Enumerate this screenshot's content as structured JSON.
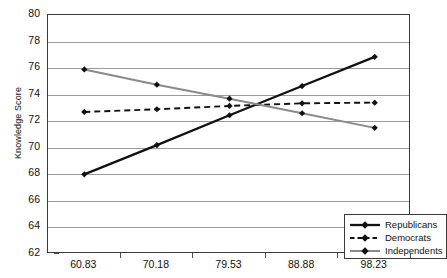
{
  "chart_data": {
    "type": "line",
    "title": "",
    "xlabel": "",
    "ylabel": "Knowledge Score",
    "categories": [
      "60.83",
      "70.18",
      "79.53",
      "88.88",
      "98.23"
    ],
    "ylim": [
      62,
      80
    ],
    "yticks": [
      62,
      64,
      66,
      68,
      70,
      72,
      74,
      76,
      78,
      80
    ],
    "grid": true,
    "legend_position": "bottom-right",
    "series": [
      {
        "name": "Republicans",
        "values": [
          68.0,
          70.2,
          72.45,
          74.65,
          76.85
        ],
        "color": "#111111",
        "style": "solid",
        "width": 2.3,
        "marker": "diamond"
      },
      {
        "name": "Democrats",
        "values": [
          72.7,
          72.9,
          73.15,
          73.35,
          73.4
        ],
        "color": "#111111",
        "style": "dashed",
        "width": 1.9,
        "marker": "diamond"
      },
      {
        "name": "Independents",
        "values": [
          75.9,
          74.75,
          73.7,
          72.6,
          71.5
        ],
        "color": "#8a8a8a",
        "style": "solid",
        "width": 2.0,
        "marker": "diamond"
      }
    ]
  },
  "axes": {
    "y_axis_title": "Knowledge Score"
  }
}
